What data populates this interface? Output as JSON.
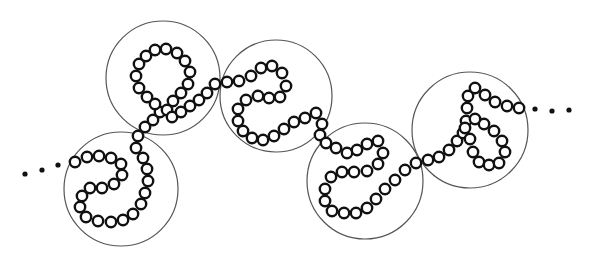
{
  "figure": {
    "bead_radius": 5.2,
    "colors": {
      "background": "#ffffff",
      "bead_stroke": "#111111",
      "blob_stroke": "#555555",
      "dot": "#111111"
    },
    "continuation_left": [
      [
        25,
        174
      ],
      [
        42,
        170
      ],
      [
        58,
        165
      ]
    ],
    "continuation_right": [
      [
        535,
        109
      ],
      [
        552,
        111
      ],
      [
        569,
        110
      ]
    ],
    "blobs": [
      {
        "cx": 121,
        "cy": 189,
        "r": 57
      },
      {
        "cx": 163,
        "cy": 78,
        "r": 57
      },
      {
        "cx": 276,
        "cy": 96,
        "r": 56
      },
      {
        "cx": 365,
        "cy": 181,
        "r": 58
      },
      {
        "cx": 470,
        "cy": 130,
        "r": 58
      }
    ],
    "chain": [
      [
        75,
        162
      ],
      [
        87,
        157
      ],
      [
        99,
        156
      ],
      [
        111,
        158
      ],
      [
        121,
        164
      ],
      [
        122,
        175
      ],
      [
        114,
        184
      ],
      [
        102,
        188
      ],
      [
        90,
        188
      ],
      [
        82,
        196
      ],
      [
        80,
        207
      ],
      [
        86,
        217
      ],
      [
        98,
        221
      ],
      [
        111,
        222
      ],
      [
        123,
        220
      ],
      [
        133,
        214
      ],
      [
        141,
        204
      ],
      [
        145,
        193
      ],
      [
        148,
        181
      ],
      [
        147,
        169
      ],
      [
        143,
        158
      ],
      [
        136,
        148
      ],
      [
        138,
        136
      ],
      [
        145,
        127
      ],
      [
        153,
        120
      ],
      [
        160,
        112
      ],
      [
        155,
        104
      ],
      [
        147,
        97
      ],
      [
        139,
        88
      ],
      [
        136,
        76
      ],
      [
        139,
        64
      ],
      [
        146,
        56
      ],
      [
        155,
        50
      ],
      [
        166,
        49
      ],
      [
        177,
        53
      ],
      [
        185,
        61
      ],
      [
        190,
        72
      ],
      [
        188,
        84
      ],
      [
        181,
        93
      ],
      [
        173,
        101
      ],
      [
        167,
        110
      ],
      [
        172,
        117
      ],
      [
        181,
        112
      ],
      [
        190,
        106
      ],
      [
        199,
        100
      ],
      [
        207,
        93
      ],
      [
        215,
        84
      ],
      [
        227,
        82
      ],
      [
        239,
        81
      ],
      [
        251,
        76
      ],
      [
        261,
        68
      ],
      [
        272,
        66
      ],
      [
        282,
        73
      ],
      [
        286,
        86
      ],
      [
        280,
        97
      ],
      [
        269,
        98
      ],
      [
        258,
        96
      ],
      [
        246,
        100
      ],
      [
        238,
        109
      ],
      [
        238,
        121
      ],
      [
        243,
        131
      ],
      [
        252,
        138
      ],
      [
        263,
        140
      ],
      [
        274,
        136
      ],
      [
        284,
        129
      ],
      [
        294,
        122
      ],
      [
        305,
        118
      ],
      [
        316,
        113
      ],
      [
        322,
        124
      ],
      [
        320,
        135
      ],
      [
        326,
        143
      ],
      [
        336,
        148
      ],
      [
        347,
        153
      ],
      [
        357,
        150
      ],
      [
        367,
        144
      ],
      [
        378,
        141
      ],
      [
        383,
        153
      ],
      [
        378,
        164
      ],
      [
        367,
        171
      ],
      [
        354,
        172
      ],
      [
        342,
        172
      ],
      [
        331,
        177
      ],
      [
        325,
        189
      ],
      [
        325,
        201
      ],
      [
        332,
        211
      ],
      [
        344,
        213
      ],
      [
        356,
        213
      ],
      [
        367,
        208
      ],
      [
        376,
        199
      ],
      [
        385,
        189
      ],
      [
        395,
        180
      ],
      [
        405,
        170
      ],
      [
        416,
        163
      ],
      [
        428,
        160
      ],
      [
        439,
        157
      ],
      [
        449,
        150
      ],
      [
        457,
        141
      ],
      [
        463,
        133
      ],
      [
        466,
        121
      ],
      [
        467,
        108
      ],
      [
        468,
        96
      ],
      [
        475,
        88
      ],
      [
        485,
        95
      ],
      [
        495,
        102
      ],
      [
        507,
        106
      ],
      [
        519,
        108
      ],
      [
        465,
        128
      ],
      [
        470,
        139
      ],
      [
        473,
        152
      ],
      [
        479,
        162
      ],
      [
        489,
        165
      ],
      [
        499,
        163
      ],
      [
        505,
        152
      ],
      [
        502,
        141
      ],
      [
        494,
        131
      ],
      [
        484,
        124
      ],
      [
        475,
        119
      ]
    ]
  }
}
